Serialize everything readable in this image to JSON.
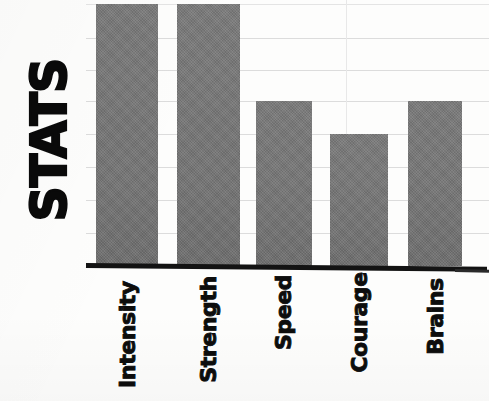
{
  "chart_data": {
    "type": "bar",
    "title": "STATS",
    "xlabel": "",
    "ylabel": "STATS",
    "categories": [
      "Intensity",
      "Strength",
      "Speed",
      "Courage",
      "Brains"
    ],
    "values": [
      8,
      8,
      5,
      4,
      5
    ],
    "ylim": [
      0,
      8
    ],
    "grid": true,
    "gridline_count": 8,
    "legend": "none",
    "series": [
      {
        "name": "STATS",
        "values": [
          8,
          8,
          5,
          4,
          5
        ],
        "color": "#797979"
      }
    ],
    "style": {
      "background": "#fdfdfc",
      "bar_fill": "#797979",
      "gridline_color": "#dcdcdc",
      "axis_color": "#131313",
      "label_color": "#0d0d0d"
    }
  },
  "axes": {
    "y_axis_title": "STATS",
    "baseline_present": true
  },
  "bars": [
    {
      "label": "Intensity",
      "value": 8,
      "left": 10,
      "width": 62,
      "top": 4,
      "clipped": true
    },
    {
      "label": "Strength",
      "value": 8,
      "left": 91,
      "width": 63,
      "top": 4,
      "clipped": true
    },
    {
      "label": "Speed",
      "value": 5,
      "left": 170,
      "width": 56,
      "top": 101,
      "clipped": false
    },
    {
      "label": "Courage",
      "value": 4,
      "left": 244,
      "width": 58,
      "top": 134,
      "clipped": false
    },
    {
      "label": "Brains",
      "value": 5,
      "left": 322,
      "width": 54,
      "top": 101,
      "clipped": false
    }
  ],
  "gridlines": [
    {
      "y": 4
    },
    {
      "y": 38
    },
    {
      "y": 70
    },
    {
      "y": 101
    },
    {
      "y": 134
    },
    {
      "y": 167
    },
    {
      "y": 200
    },
    {
      "y": 233
    }
  ],
  "category_slots": [
    {
      "label": "Intensity",
      "center": 41,
      "len_class": "len9"
    },
    {
      "label": "Strength",
      "center": 122,
      "len_class": "len8"
    },
    {
      "label": "Speed",
      "center": 198,
      "len_class": "len5"
    },
    {
      "label": "Courage",
      "center": 273,
      "len_class": "len7"
    },
    {
      "label": "Brains",
      "center": 349,
      "len_class": "len6"
    }
  ]
}
